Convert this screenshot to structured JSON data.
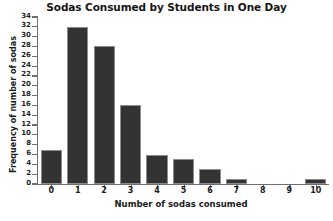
{
  "chart_data": {
    "type": "bar",
    "title": "Sodas Consumed by Students in One Day",
    "xlabel": "Number of sodas consumed",
    "ylabel": "Frequency of number of sodas",
    "categories": [
      "0",
      "1",
      "2",
      "3",
      "4",
      "5",
      "6",
      "7",
      "8",
      "9",
      "10"
    ],
    "values": [
      7,
      32,
      28,
      16,
      6,
      5,
      3,
      1,
      0,
      0,
      1
    ],
    "ylim": [
      0,
      34
    ],
    "ytick_labels": [
      "34",
      "32",
      "30",
      "28",
      "26",
      "24",
      "22",
      "20",
      "18",
      "16",
      "14",
      "12",
      "10",
      "8",
      "6",
      "4",
      "2",
      "0"
    ],
    "ytick_values": [
      34,
      32,
      30,
      28,
      26,
      24,
      22,
      20,
      18,
      16,
      14,
      12,
      10,
      8,
      6,
      4,
      2,
      0
    ],
    "ytick_step": 2,
    "grid": false,
    "legend": null,
    "bar_color": "#333333",
    "bar_edge_color": "#8c8c8c",
    "axis_color": "#6f6f6f",
    "background_color": "#ffffff"
  }
}
